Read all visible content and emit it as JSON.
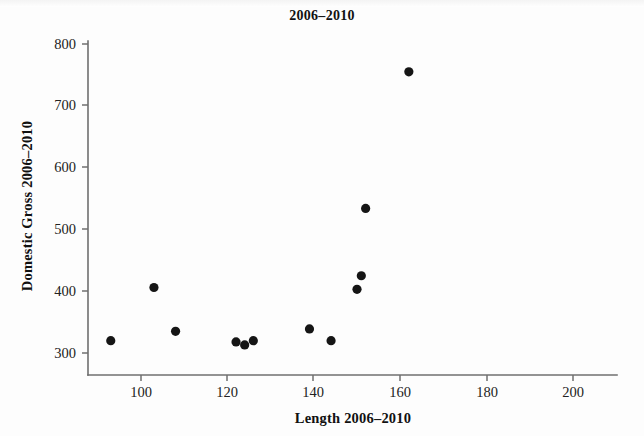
{
  "figure": {
    "width": 644,
    "height": 436,
    "background_color": "#fdfdfd",
    "point_color": "#151515",
    "axis_color": "#6f6f6f"
  },
  "chart_data": {
    "type": "scatter",
    "title": "2006–2010",
    "xlabel": "Length 2006–2010",
    "ylabel": "Domestic Gross 2006–2010",
    "xlim": [
      88,
      207
    ],
    "ylim": [
      283,
      810
    ],
    "xticks": [
      100,
      120,
      140,
      160,
      180,
      200
    ],
    "xtick_labels": [
      "100",
      "120",
      "140",
      "160",
      "180",
      "200"
    ],
    "yticks": [
      300,
      400,
      500,
      600,
      700,
      800
    ],
    "ytick_labels": [
      "300",
      "400",
      "500",
      "600",
      "700",
      "800"
    ],
    "grid": false,
    "legend": null,
    "marker": "filled-circle",
    "marker_size": 4.6,
    "points": [
      {
        "x": 93,
        "y": 320
      },
      {
        "x": 103,
        "y": 406
      },
      {
        "x": 108,
        "y": 335
      },
      {
        "x": 122,
        "y": 318
      },
      {
        "x": 124,
        "y": 313
      },
      {
        "x": 126,
        "y": 320
      },
      {
        "x": 139,
        "y": 339
      },
      {
        "x": 144,
        "y": 320
      },
      {
        "x": 150,
        "y": 403
      },
      {
        "x": 151,
        "y": 425
      },
      {
        "x": 152,
        "y": 534
      },
      {
        "x": 162,
        "y": 755
      }
    ]
  }
}
